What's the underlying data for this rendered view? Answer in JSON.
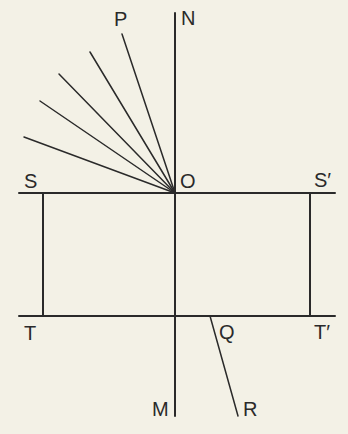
{
  "diagram": {
    "colors": {
      "background": "#f3f1e6",
      "stroke": "#2a2a2a"
    },
    "labels": {
      "P": "P",
      "N": "N",
      "S": "S",
      "O": "O",
      "S_prime": "S′",
      "T": "T",
      "Q": "Q",
      "T_prime": "T′",
      "M": "M",
      "R": "R"
    },
    "points": {
      "O": [
        175,
        193
      ],
      "N_top": [
        175,
        13
      ],
      "M_bottom": [
        175,
        416
      ],
      "S_left": [
        19,
        193
      ],
      "S_prime_right": [
        335,
        193
      ],
      "T_left": [
        19,
        316
      ],
      "T_prime_right": [
        335,
        316
      ],
      "Q": [
        210,
        316
      ],
      "R": [
        238,
        416
      ],
      "left_post_x": 43,
      "right_post_x": 310
    },
    "rays_from_O": [
      {
        "name": "OP",
        "end": [
          122,
          34
        ]
      },
      {
        "name": "ray-2",
        "end": [
          90,
          52
        ]
      },
      {
        "name": "ray-3",
        "end": [
          59,
          74
        ]
      },
      {
        "name": "ray-4",
        "end": [
          40,
          101
        ]
      },
      {
        "name": "ray-5",
        "end": [
          24,
          137
        ]
      }
    ]
  }
}
